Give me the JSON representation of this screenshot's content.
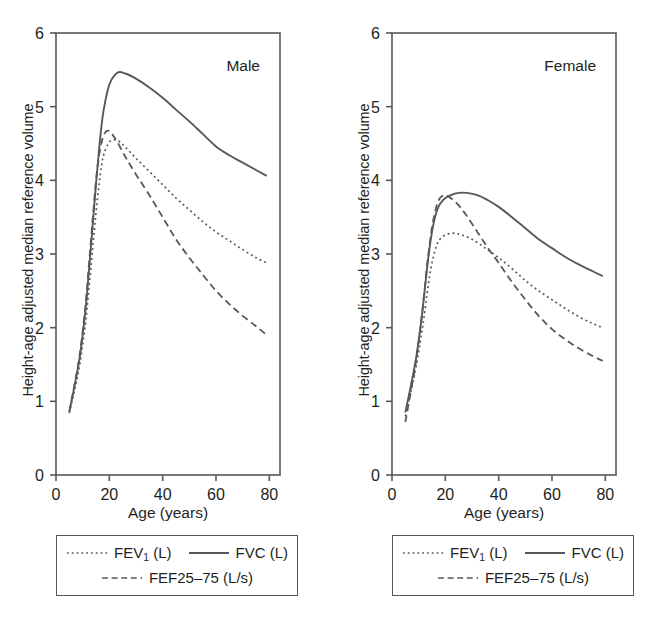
{
  "figure": {
    "ylabel": "Height-age adjusted median reference volume",
    "xlabel": "Age (years)"
  },
  "legend": {
    "fev1_label": "FEV",
    "fev1_sub": "1",
    "fev1_unit": " (L)",
    "fvc_label": "FVC (L)",
    "fef_label": "FEF25–75 (L/s)",
    "styles": {
      "fev1": "dotted-line-swatch",
      "fvc": "solid-line-swatch",
      "fef": "dashed-line-swatch"
    }
  },
  "colors": {
    "line": "#58585a",
    "axis": "#58585a",
    "text": "#231f20",
    "background": "#ffffff"
  },
  "chart_data": [
    {
      "type": "line",
      "title": "Male",
      "xlabel": "Age (years)",
      "ylabel": "Height-age adjusted median reference volume",
      "xlim": [
        0,
        84
      ],
      "ylim": [
        0,
        6
      ],
      "xticks": [
        0,
        20,
        40,
        60,
        80
      ],
      "yticks": [
        0,
        1,
        2,
        3,
        4,
        5,
        6
      ],
      "grid": false,
      "legend_position": "below-axes",
      "series": [
        {
          "name": "FVC (L)",
          "style": "solid",
          "x": [
            5,
            7,
            9,
            11,
            12,
            13,
            14,
            15,
            16,
            17,
            18,
            20,
            23,
            26,
            30,
            35,
            40,
            45,
            50,
            55,
            60,
            65,
            70,
            75,
            79
          ],
          "y": [
            0.86,
            1.22,
            1.62,
            2.22,
            2.62,
            3.05,
            3.5,
            3.95,
            4.36,
            4.72,
            4.98,
            5.3,
            5.46,
            5.45,
            5.38,
            5.26,
            5.12,
            4.96,
            4.8,
            4.63,
            4.46,
            4.34,
            4.24,
            4.14,
            4.06
          ]
        },
        {
          "name": "FEV1 (L)",
          "style": "dotted",
          "x": [
            5,
            7,
            9,
            11,
            12,
            13,
            14,
            15,
            16,
            17,
            18,
            20,
            22,
            24,
            26,
            30,
            35,
            40,
            45,
            50,
            55,
            60,
            65,
            70,
            75,
            79
          ],
          "y": [
            0.84,
            1.16,
            1.52,
            2.04,
            2.4,
            2.78,
            3.18,
            3.56,
            3.9,
            4.18,
            4.36,
            4.52,
            4.55,
            4.52,
            4.45,
            4.3,
            4.12,
            3.94,
            3.76,
            3.6,
            3.44,
            3.3,
            3.18,
            3.06,
            2.95,
            2.88
          ]
        },
        {
          "name": "FEF25-75 (L/s)",
          "style": "dashed",
          "x": [
            5,
            7,
            9,
            11,
            12,
            13,
            14,
            15,
            16,
            17,
            18,
            19,
            20,
            21,
            23,
            26,
            30,
            35,
            40,
            45,
            50,
            55,
            60,
            65,
            70,
            75,
            79
          ],
          "y": [
            0.86,
            1.24,
            1.66,
            2.28,
            2.7,
            3.14,
            3.58,
            4.0,
            4.3,
            4.5,
            4.62,
            4.67,
            4.67,
            4.63,
            4.52,
            4.32,
            4.08,
            3.8,
            3.5,
            3.2,
            2.95,
            2.72,
            2.5,
            2.32,
            2.16,
            2.02,
            1.9
          ]
        }
      ]
    },
    {
      "type": "line",
      "title": "Female",
      "xlabel": "Age (years)",
      "ylabel": "Height-age adjusted median reference volume",
      "xlim": [
        0,
        84
      ],
      "ylim": [
        0,
        6
      ],
      "xticks": [
        0,
        20,
        40,
        60,
        80
      ],
      "yticks": [
        0,
        1,
        2,
        3,
        4,
        5,
        6
      ],
      "grid": false,
      "legend_position": "below-axes",
      "series": [
        {
          "name": "FVC (L)",
          "style": "solid",
          "x": [
            5,
            7,
            9,
            11,
            12,
            13,
            14,
            15,
            16,
            17,
            18,
            20,
            22,
            25,
            28,
            32,
            36,
            40,
            45,
            50,
            55,
            60,
            65,
            70,
            75,
            79
          ],
          "y": [
            0.85,
            1.2,
            1.58,
            2.1,
            2.42,
            2.76,
            3.06,
            3.3,
            3.48,
            3.6,
            3.68,
            3.76,
            3.8,
            3.83,
            3.83,
            3.8,
            3.73,
            3.64,
            3.5,
            3.35,
            3.2,
            3.08,
            2.96,
            2.86,
            2.77,
            2.7
          ]
        },
        {
          "name": "FEV1 (L)",
          "style": "dotted",
          "x": [
            5,
            7,
            9,
            11,
            12,
            13,
            14,
            15,
            16,
            17,
            18,
            20,
            22,
            24,
            26,
            30,
            35,
            40,
            45,
            50,
            55,
            60,
            65,
            70,
            75,
            79
          ],
          "y": [
            0.8,
            1.12,
            1.46,
            1.9,
            2.14,
            2.42,
            2.68,
            2.88,
            3.03,
            3.14,
            3.2,
            3.26,
            3.28,
            3.28,
            3.26,
            3.2,
            3.08,
            2.95,
            2.8,
            2.64,
            2.5,
            2.38,
            2.26,
            2.15,
            2.06,
            2.0
          ]
        },
        {
          "name": "FEF25-75 (L/s)",
          "style": "dashed",
          "x": [
            5,
            7,
            9,
            11,
            12,
            13,
            14,
            15,
            16,
            17,
            18,
            19,
            20,
            22,
            25,
            28,
            32,
            36,
            40,
            45,
            50,
            55,
            60,
            65,
            70,
            75,
            79
          ],
          "y": [
            0.72,
            1.12,
            1.54,
            2.1,
            2.44,
            2.8,
            3.1,
            3.36,
            3.55,
            3.68,
            3.76,
            3.79,
            3.8,
            3.76,
            3.66,
            3.52,
            3.3,
            3.08,
            2.88,
            2.62,
            2.38,
            2.16,
            1.98,
            1.84,
            1.72,
            1.62,
            1.55
          ]
        }
      ]
    }
  ]
}
